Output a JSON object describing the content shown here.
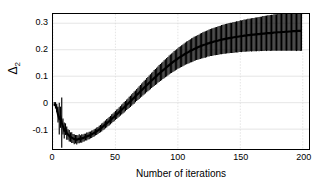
{
  "chart_data": {
    "type": "line",
    "title": "",
    "xlabel": "Number of iterations",
    "ylabel": "Δ̂2",
    "ylabel_symbol": "Δ",
    "ylabel_sub": "2",
    "xlim": [
      0,
      205
    ],
    "ylim": [
      -0.175,
      0.335
    ],
    "xticks": [
      0,
      50,
      100,
      150,
      200
    ],
    "xticklabels": [
      "0",
      "50",
      "100",
      "150",
      "200"
    ],
    "yticks": [
      -0.1,
      0,
      0.1,
      0.2,
      0.3
    ],
    "yticklabels": [
      "-0.1",
      "0",
      "0.1",
      "0.2",
      "0.3"
    ],
    "grid": true,
    "grid_color": "#d9d9d9",
    "series_color": "#000000",
    "legend": null,
    "x": [
      1,
      2,
      3,
      4,
      5,
      6,
      7,
      8,
      9,
      10,
      11,
      12,
      13,
      14,
      15,
      16,
      17,
      18,
      19,
      20,
      21,
      22,
      23,
      24,
      25,
      26,
      27,
      28,
      29,
      30,
      31,
      32,
      33,
      34,
      35,
      36,
      37,
      38,
      39,
      40,
      41,
      42,
      43,
      44,
      45,
      46,
      47,
      48,
      49,
      50,
      51,
      52,
      53,
      54,
      55,
      56,
      57,
      58,
      59,
      60,
      61,
      62,
      63,
      64,
      65,
      66,
      67,
      68,
      69,
      70,
      71,
      72,
      73,
      74,
      75,
      76,
      77,
      78,
      79,
      80,
      81,
      82,
      83,
      84,
      85,
      86,
      87,
      88,
      89,
      90,
      91,
      92,
      93,
      94,
      95,
      96,
      97,
      98,
      99,
      100,
      101,
      102,
      103,
      104,
      105,
      106,
      107,
      108,
      109,
      110,
      111,
      112,
      113,
      114,
      115,
      116,
      117,
      118,
      119,
      120,
      121,
      122,
      123,
      124,
      125,
      126,
      127,
      128,
      129,
      130,
      131,
      132,
      133,
      134,
      135,
      136,
      137,
      138,
      139,
      140,
      141,
      142,
      143,
      144,
      145,
      146,
      147,
      148,
      149,
      150,
      151,
      152,
      153,
      154,
      155,
      156,
      157,
      158,
      159,
      160,
      161,
      162,
      163,
      164,
      165,
      166,
      167,
      168,
      169,
      170,
      171,
      172,
      173,
      174,
      175,
      176,
      177,
      178,
      179,
      180,
      181,
      182,
      183,
      184,
      185,
      186,
      187,
      188,
      189,
      190,
      191,
      192,
      193,
      194,
      195,
      196,
      197,
      198,
      199,
      200,
      201,
      202,
      203
    ],
    "mean": [
      -0.005,
      -0.01,
      -0.02,
      -0.045,
      -0.06,
      -0.055,
      -0.075,
      -0.09,
      -0.105,
      -0.1,
      -0.115,
      -0.12,
      -0.125,
      -0.13,
      -0.132,
      -0.135,
      -0.138,
      -0.138,
      -0.14,
      -0.138,
      -0.136,
      -0.137,
      -0.135,
      -0.134,
      -0.132,
      -0.13,
      -0.128,
      -0.126,
      -0.124,
      -0.122,
      -0.119,
      -0.117,
      -0.114,
      -0.111,
      -0.108,
      -0.105,
      -0.101,
      -0.098,
      -0.094,
      -0.09,
      -0.086,
      -0.082,
      -0.078,
      -0.074,
      -0.07,
      -0.066,
      -0.061,
      -0.057,
      -0.053,
      -0.048,
      -0.044,
      -0.04,
      -0.035,
      -0.031,
      -0.026,
      -0.022,
      -0.017,
      -0.013,
      -0.008,
      -0.004,
      0.001,
      0.005,
      0.01,
      0.015,
      0.019,
      0.024,
      0.029,
      0.033,
      0.038,
      0.043,
      0.047,
      0.052,
      0.057,
      0.061,
      0.066,
      0.07,
      0.075,
      0.079,
      0.084,
      0.088,
      0.093,
      0.097,
      0.101,
      0.106,
      0.11,
      0.114,
      0.118,
      0.122,
      0.126,
      0.13,
      0.134,
      0.138,
      0.142,
      0.146,
      0.149,
      0.153,
      0.157,
      0.16,
      0.163,
      0.167,
      0.17,
      0.173,
      0.176,
      0.179,
      0.182,
      0.185,
      0.188,
      0.19,
      0.193,
      0.196,
      0.198,
      0.2,
      0.203,
      0.205,
      0.207,
      0.209,
      0.211,
      0.213,
      0.215,
      0.217,
      0.219,
      0.22,
      0.222,
      0.224,
      0.225,
      0.227,
      0.228,
      0.229,
      0.231,
      0.232,
      0.233,
      0.234,
      0.236,
      0.237,
      0.238,
      0.239,
      0.24,
      0.241,
      0.242,
      0.243,
      0.244,
      0.245,
      0.245,
      0.246,
      0.247,
      0.248,
      0.249,
      0.249,
      0.25,
      0.251,
      0.251,
      0.252,
      0.253,
      0.253,
      0.254,
      0.255,
      0.255,
      0.256,
      0.256,
      0.257,
      0.257,
      0.258,
      0.258,
      0.259,
      0.259,
      0.26,
      0.26,
      0.261,
      0.261,
      0.262,
      0.262,
      0.263,
      0.263,
      0.263,
      0.264,
      0.264,
      0.265,
      0.265,
      0.265,
      0.266,
      0.266,
      0.266,
      0.267,
      0.267,
      0.267,
      0.268,
      0.268,
      0.268,
      0.269,
      0.269,
      0.269,
      0.27,
      0.27,
      0.27,
      0.27,
      0.271,
      0.271,
      0.271,
      0.272
    ],
    "spread": [
      0.008,
      0.012,
      0.016,
      0.03,
      0.06,
      0.04,
      0.095,
      0.03,
      0.03,
      0.022,
      0.025,
      0.02,
      0.022,
      0.018,
      0.02,
      0.017,
      0.019,
      0.016,
      0.018,
      0.015,
      0.017,
      0.014,
      0.016,
      0.014,
      0.015,
      0.013,
      0.015,
      0.013,
      0.014,
      0.013,
      0.014,
      0.013,
      0.014,
      0.013,
      0.014,
      0.013,
      0.014,
      0.014,
      0.015,
      0.014,
      0.015,
      0.015,
      0.016,
      0.015,
      0.016,
      0.016,
      0.017,
      0.016,
      0.017,
      0.017,
      0.018,
      0.017,
      0.018,
      0.018,
      0.019,
      0.019,
      0.02,
      0.019,
      0.02,
      0.02,
      0.021,
      0.021,
      0.022,
      0.022,
      0.023,
      0.022,
      0.023,
      0.023,
      0.024,
      0.024,
      0.025,
      0.025,
      0.026,
      0.026,
      0.027,
      0.027,
      0.028,
      0.028,
      0.029,
      0.029,
      0.03,
      0.03,
      0.031,
      0.031,
      0.032,
      0.032,
      0.033,
      0.033,
      0.034,
      0.034,
      0.035,
      0.035,
      0.036,
      0.036,
      0.037,
      0.037,
      0.038,
      0.038,
      0.039,
      0.039,
      0.04,
      0.04,
      0.041,
      0.041,
      0.042,
      0.042,
      0.043,
      0.043,
      0.044,
      0.044,
      0.045,
      0.045,
      0.046,
      0.046,
      0.046,
      0.047,
      0.047,
      0.048,
      0.048,
      0.049,
      0.049,
      0.05,
      0.05,
      0.05,
      0.051,
      0.051,
      0.052,
      0.052,
      0.052,
      0.053,
      0.053,
      0.054,
      0.054,
      0.054,
      0.055,
      0.055,
      0.055,
      0.056,
      0.056,
      0.056,
      0.057,
      0.057,
      0.057,
      0.058,
      0.058,
      0.058,
      0.059,
      0.059,
      0.059,
      0.06,
      0.06,
      0.06,
      0.061,
      0.061,
      0.061,
      0.062,
      0.062,
      0.062,
      0.063,
      0.063,
      0.063,
      0.064,
      0.064,
      0.064,
      0.065,
      0.065,
      0.065,
      0.066,
      0.066,
      0.066,
      0.067,
      0.067,
      0.067,
      0.068,
      0.068,
      0.068,
      0.069,
      0.069,
      0.069,
      0.07,
      0.07,
      0.07,
      0.071,
      0.071,
      0.071,
      0.072,
      0.072,
      0.072,
      0.073,
      0.073,
      0.073,
      0.074,
      0.074,
      0.074,
      0.075,
      0.075,
      0.075,
      0.076,
      0.076
    ]
  }
}
